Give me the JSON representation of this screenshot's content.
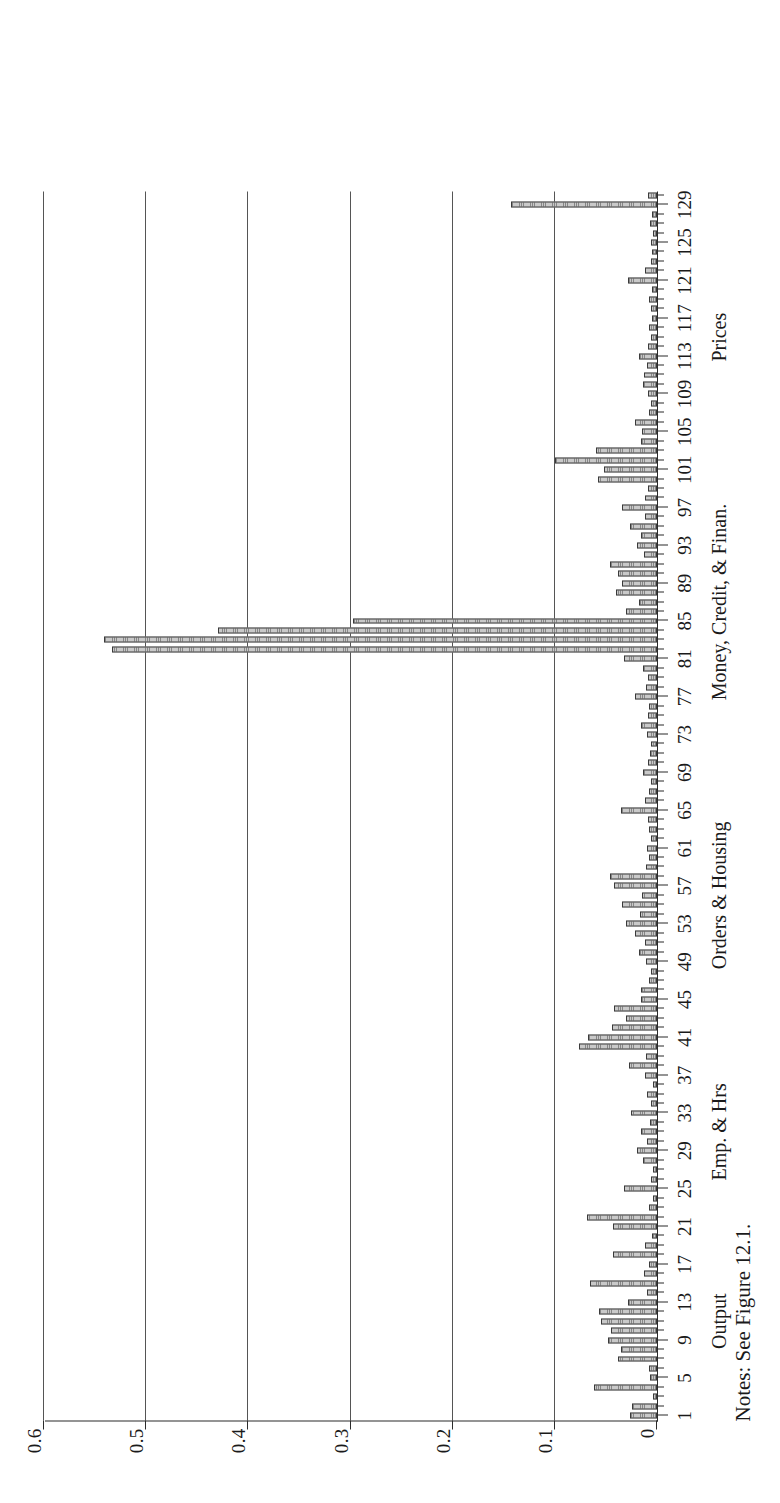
{
  "figure": {
    "notes": "Notes: See Figure 12.1.",
    "y_axis_title": "R-squares"
  },
  "chart_data": {
    "type": "bar",
    "title": "",
    "xlabel": "",
    "ylabel": "R-squares",
    "ylim": [
      0,
      0.6
    ],
    "xlim": [
      0.5,
      130.5
    ],
    "grid": "horizontal",
    "legend": "none",
    "orientation": "vertical-bars-rotated-90ccw",
    "ytick_labels": [
      "0",
      "0.1",
      "0.2",
      "0.3",
      "0.4",
      "0.5",
      "0.6"
    ],
    "ytick_values": [
      0,
      0.1,
      0.2,
      0.3,
      0.4,
      0.5,
      0.6
    ],
    "xtick_labels": [
      "1",
      "5",
      "9",
      "13",
      "17",
      "21",
      "25",
      "29",
      "33",
      "37",
      "41",
      "45",
      "49",
      "53",
      "57",
      "61",
      "65",
      "69",
      "73",
      "77",
      "81",
      "85",
      "89",
      "93",
      "97",
      "101",
      "105",
      "109",
      "113",
      "117",
      "121",
      "125",
      "129"
    ],
    "xtick_values": [
      1,
      5,
      9,
      13,
      17,
      21,
      25,
      29,
      33,
      37,
      41,
      45,
      49,
      53,
      57,
      61,
      65,
      69,
      73,
      77,
      81,
      85,
      89,
      93,
      97,
      101,
      105,
      109,
      113,
      117,
      121,
      125,
      129
    ],
    "group_labels": [
      {
        "label": "Output",
        "center": 11
      },
      {
        "label": "Emp. & Hrs",
        "center": 31
      },
      {
        "label": "Orders & Housing",
        "center": 56
      },
      {
        "label": "Money, Credit, & Finan.",
        "center": 87
      },
      {
        "label": "Prices",
        "center": 115
      }
    ],
    "categories": [
      1,
      2,
      3,
      4,
      5,
      6,
      7,
      8,
      9,
      10,
      11,
      12,
      13,
      14,
      15,
      16,
      17,
      18,
      19,
      20,
      21,
      22,
      23,
      24,
      25,
      26,
      27,
      28,
      29,
      30,
      31,
      32,
      33,
      34,
      35,
      36,
      37,
      38,
      39,
      40,
      41,
      42,
      43,
      44,
      45,
      46,
      47,
      48,
      49,
      50,
      51,
      52,
      53,
      54,
      55,
      56,
      57,
      58,
      59,
      60,
      61,
      62,
      63,
      64,
      65,
      66,
      67,
      68,
      69,
      70,
      71,
      72,
      73,
      74,
      75,
      76,
      77,
      78,
      79,
      80,
      81,
      82,
      83,
      84,
      85,
      86,
      87,
      88,
      89,
      90,
      91,
      92,
      93,
      94,
      95,
      96,
      97,
      98,
      99,
      100,
      101,
      102,
      103,
      104,
      105,
      106,
      107,
      108,
      109,
      110,
      111,
      112,
      113,
      114,
      115,
      116,
      117,
      118,
      119,
      120,
      121,
      122,
      123,
      124,
      125,
      126,
      127,
      128,
      129,
      130
    ],
    "values": [
      0.026,
      0.024,
      0.004,
      0.062,
      0.007,
      0.008,
      0.038,
      0.035,
      0.048,
      0.045,
      0.055,
      0.057,
      0.028,
      0.01,
      0.066,
      0.013,
      0.008,
      0.043,
      0.012,
      0.005,
      0.043,
      0.069,
      0.008,
      0.004,
      0.032,
      0.006,
      0.004,
      0.014,
      0.02,
      0.01,
      0.016,
      0.007,
      0.025,
      0.006,
      0.01,
      0.004,
      0.012,
      0.027,
      0.011,
      0.076,
      0.068,
      0.044,
      0.03,
      0.042,
      0.016,
      0.016,
      0.008,
      0.006,
      0.011,
      0.018,
      0.012,
      0.022,
      0.03,
      0.017,
      0.034,
      0.015,
      0.042,
      0.046,
      0.011,
      0.008,
      0.01,
      0.006,
      0.008,
      0.009,
      0.035,
      0.012,
      0.008,
      0.006,
      0.014,
      0.009,
      0.007,
      0.006,
      0.01,
      0.016,
      0.009,
      0.008,
      0.022,
      0.011,
      0.009,
      0.014,
      0.032,
      0.533,
      0.541,
      0.43,
      0.298,
      0.03,
      0.018,
      0.04,
      0.034,
      0.038,
      0.046,
      0.013,
      0.02,
      0.016,
      0.026,
      0.012,
      0.034,
      0.012,
      0.009,
      0.058,
      0.052,
      0.1,
      0.06,
      0.016,
      0.015,
      0.022,
      0.008,
      0.006,
      0.009,
      0.014,
      0.013,
      0.01,
      0.018,
      0.009,
      0.006,
      0.008,
      0.005,
      0.006,
      0.008,
      0.005,
      0.028,
      0.012,
      0.006,
      0.005,
      0.006,
      0.004,
      0.007,
      0.005,
      0.143,
      0.009
    ]
  }
}
